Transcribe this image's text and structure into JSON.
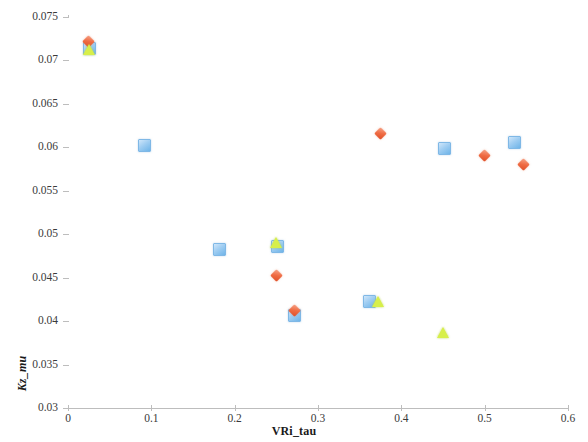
{
  "chart_data": {
    "type": "scatter",
    "title": "",
    "xlabel": "VRi_tau",
    "ylabel": "Kz_mu",
    "xlim": [
      0,
      0.6
    ],
    "ylim": [
      0.03,
      0.075
    ],
    "xticks": [
      "0",
      "0.1",
      "0.2",
      "0.3",
      "0.4",
      "0.5",
      "0.6"
    ],
    "xtick_values": [
      0,
      0.1,
      0.2,
      0.3,
      0.4,
      0.5,
      0.6
    ],
    "yticks": [
      "0.03",
      "0.035",
      "0.04",
      "0.045",
      "0.05",
      "0.055",
      "0.06",
      "0.065",
      "0.07",
      "0.075"
    ],
    "ytick_values": [
      0.03,
      0.035,
      0.04,
      0.045,
      0.05,
      0.055,
      0.06,
      0.065,
      0.07,
      0.075
    ],
    "grid": false,
    "legend_position": "top-center",
    "series": [
      {
        "name": "channel_Ri_tau=18.0",
        "marker": "square",
        "color": "#9fcdf2",
        "points": [
          {
            "x": 0.025,
            "y": 0.0715
          },
          {
            "x": 0.09,
            "y": 0.0603
          },
          {
            "x": 0.18,
            "y": 0.0483
          },
          {
            "x": 0.25,
            "y": 0.0487
          },
          {
            "x": 0.27,
            "y": 0.0408
          },
          {
            "x": 0.36,
            "y": 0.0424
          },
          {
            "x": 0.45,
            "y": 0.06
          },
          {
            "x": 0.535,
            "y": 0.0607
          }
        ]
      },
      {
        "name": "channel_V=0.025",
        "marker": "diamond",
        "color": "#ef6b43",
        "points": [
          {
            "x": 0.025,
            "y": 0.0722
          },
          {
            "x": 0.25,
            "y": 0.0452
          },
          {
            "x": 0.272,
            "y": 0.0412
          },
          {
            "x": 0.375,
            "y": 0.0616
          },
          {
            "x": 0.5,
            "y": 0.0591
          },
          {
            "x": 0.547,
            "y": 0.058
          }
        ]
      },
      {
        "name": "och_V=0.025",
        "marker": "triangle",
        "color": "#d7ef4a",
        "points": [
          {
            "x": 0.025,
            "y": 0.0713
          },
          {
            "x": 0.25,
            "y": 0.049
          },
          {
            "x": 0.372,
            "y": 0.0422
          },
          {
            "x": 0.45,
            "y": 0.0387
          }
        ]
      }
    ]
  },
  "axes": {
    "x_label": "VRi_tau",
    "y_label": "Kz_mu"
  },
  "legend": {
    "items": [
      {
        "label": "channel_Ri_tau=18.0",
        "icon": "square-marker-icon"
      },
      {
        "label": "channel_V=0.025",
        "icon": "diamond-marker-icon"
      },
      {
        "label": "och_V=0.025",
        "icon": "triangle-marker-icon"
      }
    ]
  }
}
